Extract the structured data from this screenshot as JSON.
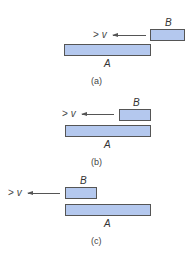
{
  "colors": {
    "block_fill": "#b4c8ee",
    "block_border": "#555555"
  },
  "panels": [
    {
      "caption": "(a)",
      "block_a": {
        "label": "A"
      },
      "block_b": {
        "label": "B"
      },
      "velocity": {
        "symbol": ">",
        "var": "v"
      }
    },
    {
      "caption": "(b)",
      "block_a": {
        "label": "A"
      },
      "block_b": {
        "label": "B"
      },
      "velocity": {
        "symbol": ">",
        "var": "v"
      }
    },
    {
      "caption": "(c)",
      "block_a": {
        "label": "A"
      },
      "block_b": {
        "label": "B"
      },
      "velocity": {
        "symbol": ">",
        "var": "v"
      }
    }
  ]
}
